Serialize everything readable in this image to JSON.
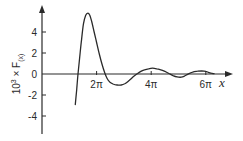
{
  "chart_data": {
    "type": "line",
    "title": "",
    "xlabel": "x",
    "ylabel": "10³ × F(x)",
    "ylabel_parts": {
      "prefix": "10",
      "sup": "3",
      "mid": " × F",
      "sub": "(x)"
    },
    "xlim": [
      0,
      6.9
    ],
    "xlim_units": "multiples of pi",
    "ylim": [
      -5,
      6
    ],
    "x_ticks": [
      {
        "value": 2,
        "label": "2π"
      },
      {
        "value": 4,
        "label": "4π"
      },
      {
        "value": 6,
        "label": "6π"
      }
    ],
    "y_ticks": [
      {
        "value": 4,
        "label": "4"
      },
      {
        "value": 2,
        "label": "2"
      },
      {
        "value": 0,
        "label": "0"
      },
      {
        "value": -2,
        "label": "-2"
      },
      {
        "value": -4,
        "label": "-4"
      }
    ],
    "grid": false,
    "legend": null,
    "series": [
      {
        "name": "F(x)",
        "x_over_pi": [
          1.22,
          1.27,
          1.32,
          1.38,
          1.45,
          1.52,
          1.6,
          1.68,
          1.75,
          1.82,
          1.9,
          2.0,
          2.1,
          2.2,
          2.3,
          2.38,
          2.48,
          2.6,
          2.75,
          2.9,
          3.05,
          3.2,
          3.35,
          3.5,
          3.62,
          3.75,
          3.9,
          4.05,
          4.2,
          4.35,
          4.5,
          4.65,
          4.8,
          4.95,
          5.1,
          5.2,
          5.3,
          5.42,
          5.55,
          5.7,
          5.85,
          6.0,
          6.1,
          6.2,
          6.3
        ],
        "values": [
          -2.9,
          -1.5,
          0.0,
          1.6,
          3.3,
          4.8,
          5.6,
          5.8,
          5.6,
          5.0,
          4.1,
          3.0,
          1.9,
          0.9,
          0.1,
          -0.4,
          -0.75,
          -0.95,
          -1.05,
          -1.05,
          -0.9,
          -0.6,
          -0.25,
          0.05,
          0.25,
          0.4,
          0.5,
          0.55,
          0.5,
          0.4,
          0.25,
          0.05,
          -0.15,
          -0.28,
          -0.3,
          -0.22,
          -0.08,
          0.08,
          0.2,
          0.28,
          0.3,
          0.25,
          0.15,
          0.08,
          0.03
        ]
      }
    ]
  },
  "layout": {
    "origin_px": [
      42,
      74
    ],
    "px_per_pi": 27.3,
    "px_per_unit_y": 10.5,
    "line_color": "#2a2a2a"
  }
}
